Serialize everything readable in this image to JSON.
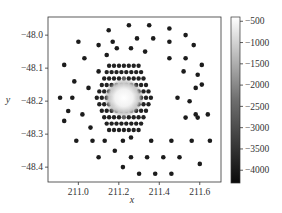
{
  "chart_data": {
    "type": "scatter",
    "title": "",
    "xlabel": "x",
    "ylabel": "y",
    "xlim": [
      210.85,
      211.705
    ],
    "ylim": [
      -48.445,
      -47.945
    ],
    "x_ticks": [
      211.0,
      211.2,
      211.4,
      211.6
    ],
    "x_tick_labels": [
      "211.0",
      "211.2",
      "211.4",
      "211.6"
    ],
    "y_ticks": [
      -48.0,
      -48.1,
      -48.2,
      -48.3,
      -48.4
    ],
    "y_tick_labels": [
      "−48.0",
      "−48.1",
      "−48.2",
      "−48.3",
      "−48.4"
    ],
    "grid": false,
    "colorbar": {
      "range": [
        -4300,
        -400
      ],
      "ticks": [
        -500,
        -1000,
        -1500,
        -2000,
        -2500,
        -3000,
        -3500,
        -4000
      ],
      "tick_labels": [
        "−500",
        "−1000",
        "−1500",
        "−2000",
        "−2500",
        "−3000",
        "−3500",
        "−4000"
      ],
      "colormap": "gray (dark = low, light = high)"
    },
    "hex_cluster": {
      "center": [
        211.225,
        -48.19
      ],
      "dx": 0.0243,
      "dy": 0.0195,
      "rows": 11,
      "max_cols": 12,
      "bright_core_radius": 0.075
    },
    "outer_points": [
      [
        211.15,
        -47.985
      ],
      [
        211.25,
        -47.97
      ],
      [
        211.35,
        -47.97
      ],
      [
        211.45,
        -47.98
      ],
      [
        211.53,
        -48.0
      ],
      [
        211.0,
        -48.02
      ],
      [
        211.1,
        -48.03
      ],
      [
        211.17,
        -48.02
      ],
      [
        211.29,
        -48.01
      ],
      [
        211.37,
        -48.01
      ],
      [
        211.45,
        -48.02
      ],
      [
        211.57,
        -48.03
      ],
      [
        211.19,
        -48.04
      ],
      [
        211.26,
        -48.04
      ],
      [
        211.33,
        -48.05
      ],
      [
        211.03,
        -48.07
      ],
      [
        211.14,
        -48.06
      ],
      [
        211.45,
        -48.07
      ],
      [
        211.53,
        -48.07
      ],
      [
        210.93,
        -48.09
      ],
      [
        211.1,
        -48.11
      ],
      [
        211.52,
        -48.11
      ],
      [
        211.59,
        -48.12
      ],
      [
        211.61,
        -48.09
      ],
      [
        210.98,
        -48.14
      ],
      [
        211.05,
        -48.16
      ],
      [
        211.58,
        -48.16
      ],
      [
        211.61,
        -48.15
      ],
      [
        210.91,
        -48.19
      ],
      [
        210.97,
        -48.19
      ],
      [
        211.49,
        -48.19
      ],
      [
        211.55,
        -48.2
      ],
      [
        210.95,
        -48.23
      ],
      [
        211.02,
        -48.24
      ],
      [
        211.58,
        -48.24
      ],
      [
        211.64,
        -48.24
      ],
      [
        210.93,
        -48.26
      ],
      [
        211.06,
        -48.28
      ],
      [
        211.53,
        -48.25
      ],
      [
        211.59,
        -48.25
      ],
      [
        210.99,
        -48.32
      ],
      [
        211.07,
        -48.32
      ],
      [
        211.13,
        -48.32
      ],
      [
        211.22,
        -48.32
      ],
      [
        211.26,
        -48.31
      ],
      [
        211.36,
        -48.32
      ],
      [
        211.46,
        -48.32
      ],
      [
        211.56,
        -48.32
      ],
      [
        211.65,
        -48.32
      ],
      [
        211.18,
        -48.35
      ],
      [
        211.1,
        -48.37
      ],
      [
        211.26,
        -48.37
      ],
      [
        211.34,
        -48.37
      ],
      [
        211.42,
        -48.37
      ],
      [
        211.5,
        -48.37
      ],
      [
        211.6,
        -48.39
      ],
      [
        211.22,
        -48.4
      ],
      [
        211.3,
        -48.42
      ],
      [
        211.38,
        -48.42
      ],
      [
        211.46,
        -48.42
      ]
    ]
  },
  "axes": {
    "x_label": "x",
    "y_label": "y"
  }
}
